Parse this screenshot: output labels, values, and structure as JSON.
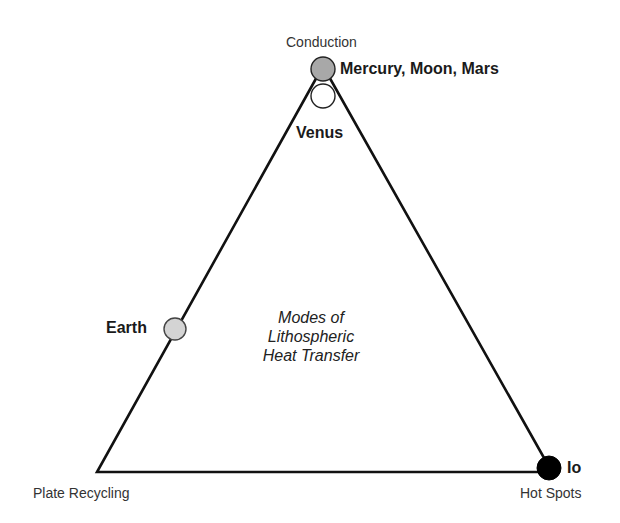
{
  "diagram": {
    "title_lines": [
      "Modes of",
      "Lithospheric",
      "Heat Transfer"
    ],
    "vertices": {
      "top": "Conduction",
      "bottom_left": "Plate Recycling",
      "bottom_right": "Hot Spots"
    },
    "bodies": [
      {
        "label": "Mercury, Moon, Mars",
        "fill": "#a8a8a8",
        "position": "top apex"
      },
      {
        "label": "Venus",
        "fill": "#ffffff",
        "position": "just below top apex"
      },
      {
        "label": "Earth",
        "fill": "#d4d4d4",
        "position": "left edge, midway"
      },
      {
        "label": "Io",
        "fill": "#000000",
        "position": "bottom-right vertex"
      }
    ],
    "colors": {
      "line": "#111111",
      "background": "#ffffff"
    }
  }
}
